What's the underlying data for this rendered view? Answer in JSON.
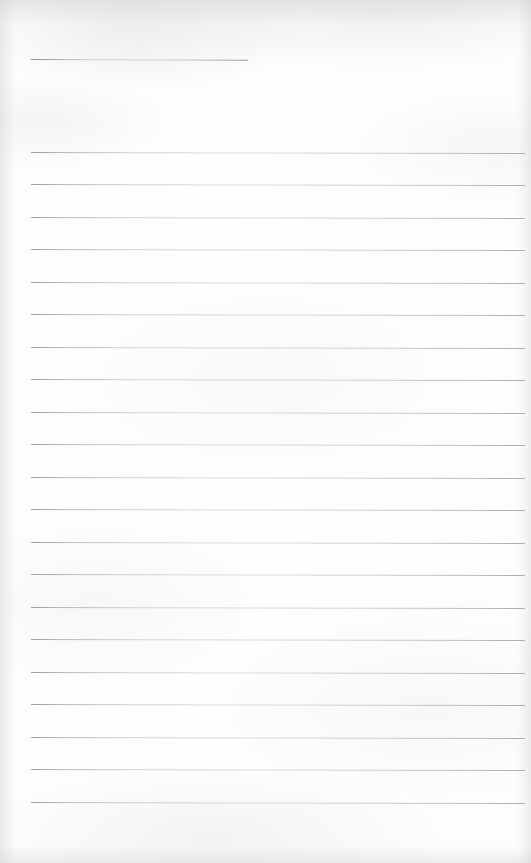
{
  "document": {
    "kind": "scanned-blank-lined-paper",
    "title": "",
    "visible_text": "",
    "page_width_px": 531,
    "page_height_px": 863,
    "background_color": "#fdfdfd",
    "rule_color": "#b5b9bd",
    "rule_thickness_px": 1
  },
  "ruling": {
    "left_margin_px": 31,
    "right_edge_px": 525,
    "line_spacing_px": 32.5,
    "first_line_y_px": 151.7,
    "last_line_y_px": 808.2,
    "full_width_line_count": 21,
    "slope_deg": 0.12
  },
  "header_rule": {
    "name": "short-top-rule",
    "x_start_px": 31,
    "x_end_px": 248,
    "y_px": 58.5,
    "width_px": 217,
    "slope_deg": 0.2
  },
  "lines": [
    {
      "index": 1,
      "y": 151.7,
      "x_start": 31,
      "x_end": 525
    },
    {
      "index": 2,
      "y": 184.2,
      "x_start": 31,
      "x_end": 525
    },
    {
      "index": 3,
      "y": 216.7,
      "x_start": 31,
      "x_end": 525
    },
    {
      "index": 4,
      "y": 249.2,
      "x_start": 31,
      "x_end": 525
    },
    {
      "index": 5,
      "y": 281.7,
      "x_start": 31,
      "x_end": 525
    },
    {
      "index": 6,
      "y": 314.2,
      "x_start": 31,
      "x_end": 525
    },
    {
      "index": 7,
      "y": 346.7,
      "x_start": 31,
      "x_end": 525
    },
    {
      "index": 8,
      "y": 379.2,
      "x_start": 31,
      "x_end": 525
    },
    {
      "index": 9,
      "y": 411.7,
      "x_start": 31,
      "x_end": 525
    },
    {
      "index": 10,
      "y": 444.2,
      "x_start": 31,
      "x_end": 525
    },
    {
      "index": 11,
      "y": 476.7,
      "x_start": 31,
      "x_end": 525
    },
    {
      "index": 12,
      "y": 509.2,
      "x_start": 31,
      "x_end": 525
    },
    {
      "index": 13,
      "y": 541.7,
      "x_start": 31,
      "x_end": 525
    },
    {
      "index": 14,
      "y": 574.2,
      "x_start": 31,
      "x_end": 525
    },
    {
      "index": 15,
      "y": 606.7,
      "x_start": 31,
      "x_end": 525
    },
    {
      "index": 16,
      "y": 639.2,
      "x_start": 31,
      "x_end": 525
    },
    {
      "index": 17,
      "y": 671.7,
      "x_start": 31,
      "x_end": 525
    },
    {
      "index": 18,
      "y": 704.2,
      "x_start": 31,
      "x_end": 525
    },
    {
      "index": 19,
      "y": 736.7,
      "x_start": 31,
      "x_end": 525
    },
    {
      "index": 20,
      "y": 769.2,
      "x_start": 31,
      "x_end": 525
    },
    {
      "index": 21,
      "y": 801.7,
      "x_start": 31,
      "x_end": 525
    }
  ]
}
